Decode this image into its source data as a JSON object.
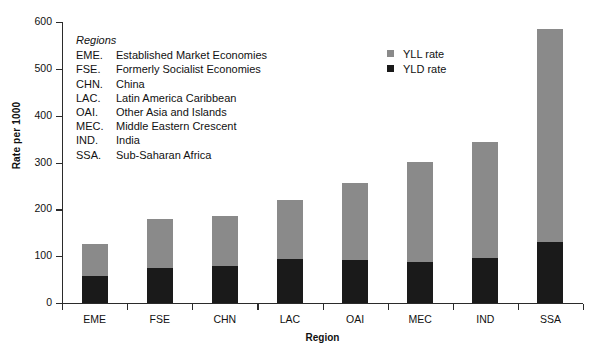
{
  "chart_data": {
    "type": "bar",
    "stacked": true,
    "title": "",
    "xlabel": "Region",
    "ylabel": "Rate per 1000",
    "ylim": [
      0,
      600
    ],
    "yticks": [
      0,
      100,
      200,
      300,
      400,
      500,
      600
    ],
    "grid": false,
    "legend_position": "upper-center-right",
    "categories": [
      "EME",
      "FSE",
      "CHN",
      "LAC",
      "OAI",
      "MEC",
      "IND",
      "SSA"
    ],
    "series": [
      {
        "name": "YLD rate",
        "color": "#1a1a1a",
        "values": [
          58,
          75,
          79,
          94,
          92,
          88,
          96,
          130
        ]
      },
      {
        "name": "YLL rate",
        "color": "#8a8a8a",
        "values": [
          68,
          104,
          107,
          126,
          164,
          213,
          248,
          455
        ]
      }
    ],
    "totals": [
      126,
      179,
      186,
      220,
      256,
      301,
      344,
      585
    ]
  },
  "axes": {
    "y_title": "Rate per 1000",
    "x_title": "Region",
    "y_tick_labels": [
      "600",
      "500",
      "400",
      "300",
      "200",
      "100",
      "0"
    ],
    "x_tick_labels": [
      "EME",
      "FSE",
      "CHN",
      "LAC",
      "OAI",
      "MEC",
      "IND",
      "SSA"
    ]
  },
  "legend": {
    "entries": [
      {
        "label": "YLL rate",
        "color": "#8a8a8a",
        "marker": "square-marker"
      },
      {
        "label": "YLD rate",
        "color": "#1a1a1a",
        "marker": "square-marker"
      }
    ]
  },
  "regions_note": {
    "title": "Regions",
    "rows": [
      {
        "code": "EME.",
        "name": "Established Market Economies"
      },
      {
        "code": "FSE.",
        "name": "Formerly Socialist Economies"
      },
      {
        "code": "CHN.",
        "name": "China"
      },
      {
        "code": "LAC.",
        "name": "Latin America Caribbean"
      },
      {
        "code": "OAI.",
        "name": "Other Asia and Islands"
      },
      {
        "code": "MEC.",
        "name": "Middle Eastern Crescent"
      },
      {
        "code": "IND.",
        "name": "India"
      },
      {
        "code": "SSA.",
        "name": "Sub-Saharan Africa"
      }
    ]
  },
  "colors": {
    "yll": "#8a8a8a",
    "yld": "#1a1a1a",
    "axis": "#2b2b2b",
    "background": "#ffffff"
  }
}
